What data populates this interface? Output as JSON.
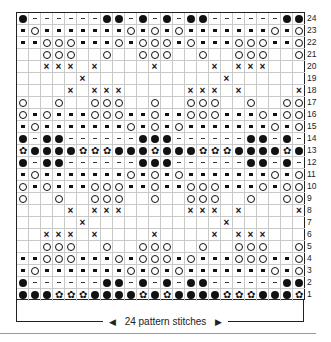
{
  "chart_data": {
    "type": "knitting_chart",
    "columns": 24,
    "rows_count": 24,
    "legend_symbols": {
      "B": "filled-dot",
      "D": "dash",
      "S": "small-square",
      "O": "open-circle",
      "X": "cross",
      "F": "flower",
      ".": "blank"
    },
    "rows": [
      {
        "num": "24",
        "cells": "BDDDDDDBBDBDBDBBDDDDDDBB"
      },
      {
        "num": "23",
        "cells": "SOSSSSSSSOSOSOSSSSSSSOSO"
      },
      {
        "num": "22",
        "cells": "SSOOOSSSOSOOOSOSSSOOOSSO"
      },
      {
        "num": "21",
        "cells": "..OOO..O..OOO..O..OOO..O"
      },
      {
        "num": "20",
        "cells": "..XXX.X....X....X.XXX..."
      },
      {
        "num": "19",
        "cells": ".....X...........X......"
      },
      {
        "num": "18",
        "cells": "....X.XXX.....XXX.X....X"
      },
      {
        "num": "17",
        "cells": "O..O..OOO..O..OOO..O..OO"
      },
      {
        "num": "16",
        "cells": "OSOSSSOOOSSOSSOOOSSSOSOO"
      },
      {
        "num": "15",
        "cells": "SOSSSSSSSOSOSOSSSSSSSOSO"
      },
      {
        "num": "14",
        "cells": "BDBBDDDDDDBBBDDDDDDBBDBD"
      },
      {
        "num": "13",
        "cells": "FBBBBFFFBBBFBBBFFFBBBBFB"
      },
      {
        "num": "12",
        "cells": "BDBBDDDDDDBBBDDDDDDBBDBD"
      },
      {
        "num": "11",
        "cells": "SOSSSSSSSOSOSOSSSSSSSOSO"
      },
      {
        "num": "10",
        "cells": "OSOSSSOOOSSOSSOOOSSSOSOO"
      },
      {
        "num": "9",
        "cells": "O..O..OOO..O..OOO..O..OO"
      },
      {
        "num": "8",
        "cells": "....X.XXX.....XXX.X....X"
      },
      {
        "num": "7",
        "cells": ".....X...........X......"
      },
      {
        "num": "6",
        "cells": "..XXX.X....X....X.XXX..."
      },
      {
        "num": "5",
        "cells": "..OOO..O..OOO..O..OOO..O"
      },
      {
        "num": "4",
        "cells": "SSOOOSSSOSOOOSOSSSOOOSSO"
      },
      {
        "num": "3",
        "cells": "SOSSSSSSSOSOSOSSSSSSSOSO"
      },
      {
        "num": "2",
        "cells": "BDDDDDDBBDBDBDBBDDDDDDBB"
      },
      {
        "num": "1",
        "cells": "BBBFFFBBBBFBFBBBBFFFBBBF"
      }
    ],
    "footer_label": "24 pattern stitches",
    "repeat_width": 24
  },
  "footer": {
    "label": "24 pattern stitches",
    "left_arrow": "◀",
    "right_arrow": "▶"
  }
}
